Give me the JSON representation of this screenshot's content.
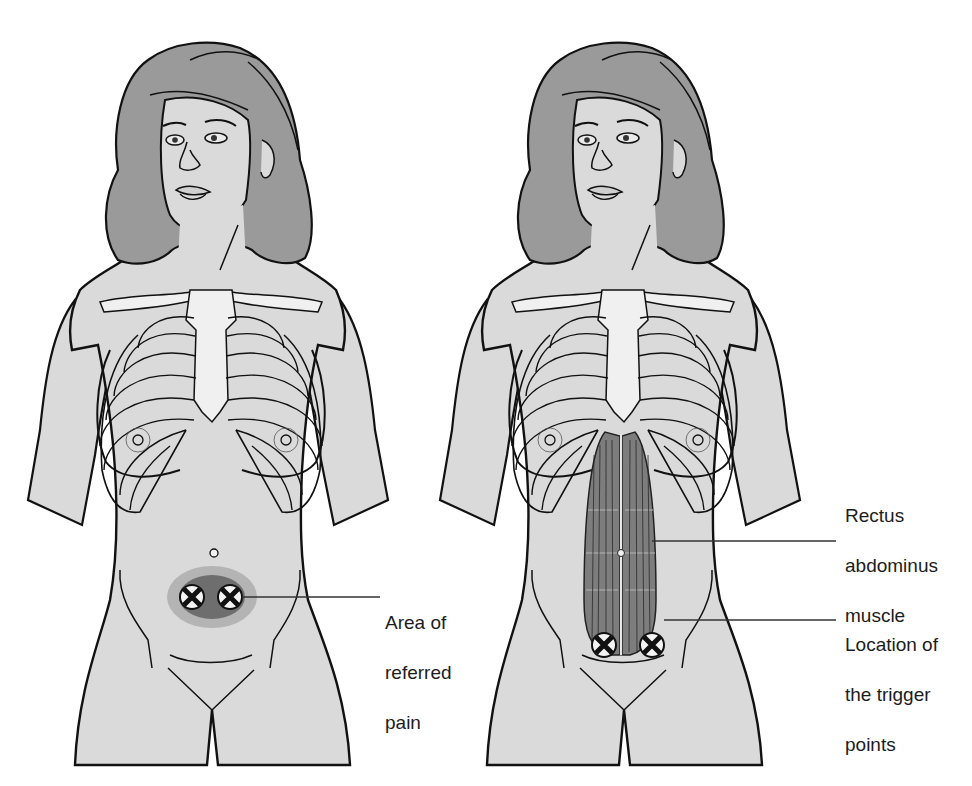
{
  "figure": {
    "left_panel": {
      "name": "referred-pain-view",
      "callout": {
        "line1": "Area of",
        "line2": "referred",
        "line3": "pain"
      },
      "trigger_marker_count": 2
    },
    "right_panel": {
      "name": "muscle-view",
      "callouts": [
        {
          "line1": "Rectus",
          "line2": "abdominus",
          "line3": "muscle"
        },
        {
          "line1": "Location of",
          "line2": "the trigger",
          "line3": "points"
        }
      ],
      "trigger_marker_count": 2
    }
  },
  "colors": {
    "skin": "#dadada",
    "hair": "#9a9a9a",
    "bone": "#f0f0f0",
    "outline": "#111111",
    "muscle": "#7d7d7d",
    "pain_outer": "#b4b4b4",
    "pain_inner": "#6e6e6e",
    "leader_line": "#333333"
  }
}
